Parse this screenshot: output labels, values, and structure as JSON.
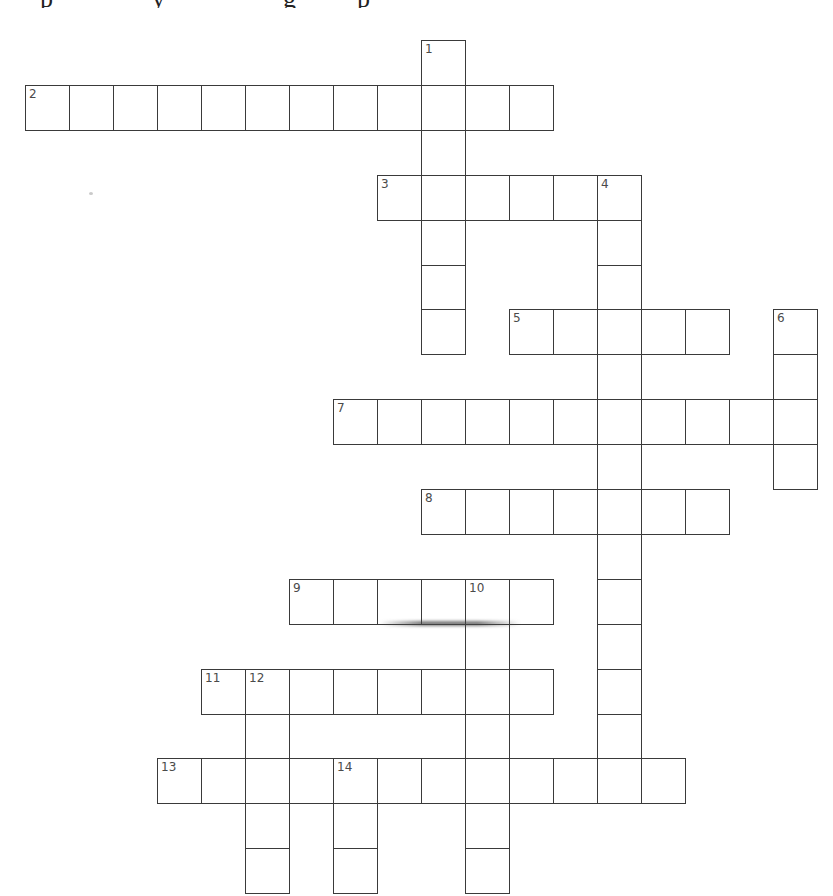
{
  "puzzle": {
    "layout": {
      "origin_x": 25,
      "origin_y": 40,
      "cell_w": 44,
      "cell_h": 44.9
    },
    "entries": [
      {
        "number": "1",
        "direction": "down",
        "col": 9,
        "row": 0,
        "length": 7
      },
      {
        "number": "2",
        "direction": "across",
        "col": 0,
        "row": 1,
        "length": 12
      },
      {
        "number": "3",
        "direction": "across",
        "col": 8,
        "row": 3,
        "length": 6
      },
      {
        "number": "4",
        "direction": "down",
        "col": 13,
        "row": 3,
        "length": 14
      },
      {
        "number": "5",
        "direction": "across",
        "col": 11,
        "row": 6,
        "length": 5
      },
      {
        "number": "6",
        "direction": "down",
        "col": 17,
        "row": 6,
        "length": 4
      },
      {
        "number": "7",
        "direction": "across",
        "col": 7,
        "row": 8,
        "length": 11
      },
      {
        "number": "8",
        "direction": "across",
        "col": 9,
        "row": 10,
        "length": 7
      },
      {
        "number": "9",
        "direction": "across",
        "col": 6,
        "row": 12,
        "length": 6
      },
      {
        "number": "10",
        "direction": "down",
        "col": 10,
        "row": 12,
        "length": 7
      },
      {
        "number": "11",
        "direction": "across",
        "col": 4,
        "row": 14,
        "length": 8
      },
      {
        "number": "12",
        "direction": "down",
        "col": 5,
        "row": 14,
        "length": 5
      },
      {
        "number": "13",
        "direction": "across",
        "col": 3,
        "row": 16,
        "length": 12
      },
      {
        "number": "14",
        "direction": "down",
        "col": 7,
        "row": 16,
        "length": 3
      }
    ]
  }
}
